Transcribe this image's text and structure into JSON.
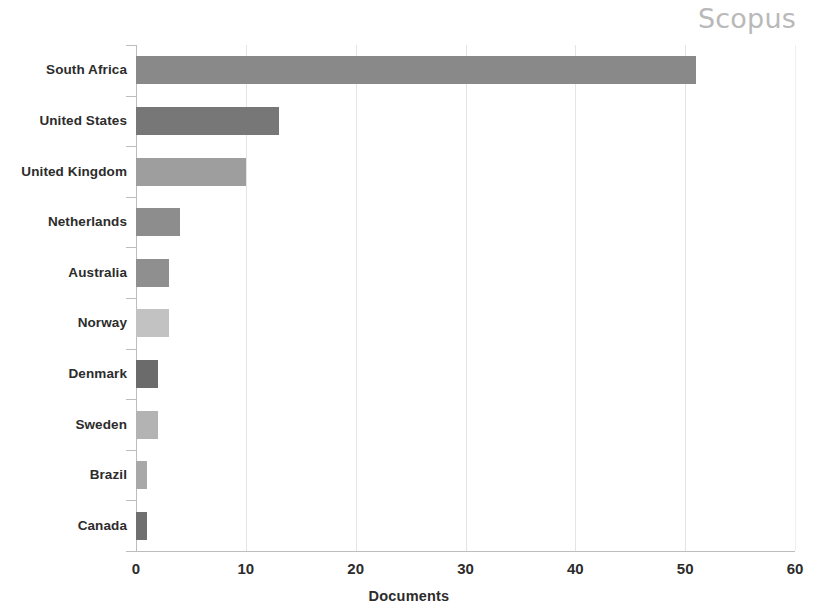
{
  "watermark": {
    "label": "Scopus",
    "color": "#b9b9b9"
  },
  "chart_data": {
    "type": "bar",
    "orientation": "horizontal",
    "title": "",
    "subtitle": "",
    "xlabel": "Documents",
    "ylabel": "",
    "xlim": [
      0,
      60
    ],
    "ylim": null,
    "xticks": [
      "0",
      "10",
      "20",
      "30",
      "40",
      "50",
      "60"
    ],
    "xtick_values": [
      0,
      10,
      20,
      30,
      40,
      50,
      60
    ],
    "grid": "vertical",
    "legend": "none",
    "categories": [
      "South Africa",
      "United States",
      "United Kingdom",
      "Netherlands",
      "Australia",
      "Norway",
      "Denmark",
      "Sweden",
      "Brazil",
      "Canada"
    ],
    "values": [
      51,
      13,
      10,
      4,
      3,
      3,
      2,
      2,
      1,
      1
    ],
    "bar_colors": [
      "#898989",
      "#777777",
      "#9e9e9e",
      "#8d8d8d",
      "#8f8f8f",
      "#c2c2c2",
      "#6b6b6b",
      "#b3b3b3",
      "#a8a8a8",
      "#6f6f6f"
    ],
    "bars": [
      {
        "category": "South Africa",
        "value": 51,
        "color": "#898989"
      },
      {
        "category": "United States",
        "value": 13,
        "color": "#777777"
      },
      {
        "category": "United Kingdom",
        "value": 10,
        "color": "#9e9e9e"
      },
      {
        "category": "Netherlands",
        "value": 4,
        "color": "#8d8d8d"
      },
      {
        "category": "Australia",
        "value": 3,
        "color": "#8f8f8f"
      },
      {
        "category": "Norway",
        "value": 3,
        "color": "#c2c2c2"
      },
      {
        "category": "Denmark",
        "value": 2,
        "color": "#6b6b6b"
      },
      {
        "category": "Sweden",
        "value": 2,
        "color": "#b3b3b3"
      },
      {
        "category": "Brazil",
        "value": 1,
        "color": "#a8a8a8"
      },
      {
        "category": "Canada",
        "value": 1,
        "color": "#6f6f6f"
      }
    ],
    "axis_color": "#bdbdbd",
    "gridline_color": "#e4e4e4"
  }
}
